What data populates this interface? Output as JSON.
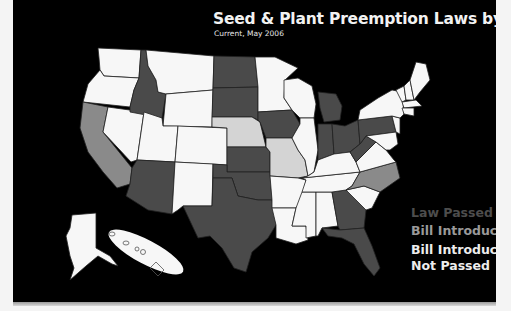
{
  "title": "Seed & Plant Preemption Laws by State",
  "subtitle": "Current, May 2006",
  "colors": {
    "background": "#000000",
    "law_passed": "#4a4a4a",
    "bill_introduced": "#8a8a8a",
    "bill_introduced_not_passed": "#d4d4d4",
    "no_action": "#f7f7f7"
  },
  "legend": [
    {
      "label": "Law Passed",
      "category": "law_passed",
      "text_color": "#4d4d4d"
    },
    {
      "label": "Bill Introduced",
      "category": "bill_introduced",
      "text_color": "#9a9a9a"
    },
    {
      "label": "Bill Introduced,",
      "label2": "Not Passed",
      "category": "bill_introduced_not_passed",
      "text_color": "#ededed"
    }
  ],
  "states": {
    "law_passed": [
      "Idaho",
      "North Dakota",
      "South Dakota",
      "Kansas",
      "Oklahoma",
      "Texas",
      "Arizona",
      "Iowa",
      "Michigan",
      "Indiana",
      "Ohio",
      "Pennsylvania",
      "West Virginia",
      "Georgia",
      "Florida"
    ],
    "bill_introduced": [
      "California",
      "North Carolina"
    ],
    "bill_introduced_not_passed": [
      "Nebraska",
      "Missouri"
    ],
    "no_action": [
      "Washington",
      "Oregon",
      "Nevada",
      "Montana",
      "Wyoming",
      "Utah",
      "Colorado",
      "New Mexico",
      "Minnesota",
      "Wisconsin",
      "Illinois",
      "Arkansas",
      "Louisiana",
      "Mississippi",
      "Alabama",
      "Tennessee",
      "Kentucky",
      "Virginia",
      "South Carolina",
      "Maryland",
      "Delaware",
      "New Jersey",
      "New York",
      "Connecticut",
      "Rhode Island",
      "Massachusetts",
      "Vermont",
      "New Hampshire",
      "Maine",
      "Alaska",
      "Hawaii"
    ]
  }
}
